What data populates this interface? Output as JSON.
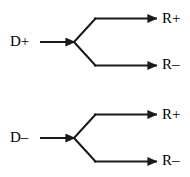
{
  "diagram": {
    "type": "branching-arrow-diagram",
    "stroke_color": "#1a1a1a",
    "background_color": "#ffffff",
    "text_color": "#000000",
    "branches": [
      {
        "id": "top",
        "input_label": "D+",
        "outputs": [
          {
            "id": "top-positive",
            "label": "R+"
          },
          {
            "id": "top-negative",
            "label": "R–"
          }
        ]
      },
      {
        "id": "bottom",
        "input_label": "D–",
        "outputs": [
          {
            "id": "bottom-positive",
            "label": "R+"
          },
          {
            "id": "bottom-negative",
            "label": "R–"
          }
        ]
      }
    ],
    "geometry": {
      "canvas_width": 190,
      "canvas_height": 177,
      "top": {
        "input_line_start_x": 40,
        "vertex_x": 75,
        "vertex_y": 42,
        "upper_branch_y": 18,
        "lower_branch_y": 66,
        "branch_corner_x": 95,
        "output_arrow_end_x": 157
      },
      "bottom": {
        "input_line_start_x": 40,
        "vertex_x": 75,
        "vertex_y": 138,
        "upper_branch_y": 114,
        "lower_branch_y": 162,
        "branch_corner_x": 95,
        "output_arrow_end_x": 157
      }
    }
  }
}
